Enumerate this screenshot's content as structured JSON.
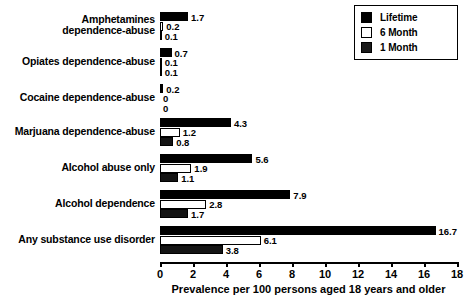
{
  "chart_data": {
    "type": "bar",
    "orientation": "horizontal",
    "title": "",
    "xlabel": "Prevalence per 100 persons aged 18 years and older",
    "ylabel": "",
    "xlim": [
      0,
      18
    ],
    "xticks": [
      0,
      2,
      4,
      6,
      8,
      10,
      12,
      14,
      16,
      18
    ],
    "grid": false,
    "legend_position": "top-right",
    "categories": [
      "Amphetamines dependence-abuse",
      "Opiates dependence-abuse",
      "Cocaine dependence-abuse",
      "Marjuana dependence-abuse",
      "Alcohol abuse only",
      "Alcohol dependence",
      "Any substance use disorder"
    ],
    "series": [
      {
        "name": "Lifetime",
        "color": "#000000",
        "values": [
          1.7,
          0.7,
          0.2,
          4.3,
          5.6,
          7.9,
          16.7
        ]
      },
      {
        "name": "6 Month",
        "color": "#ffffff",
        "values": [
          0.2,
          0.1,
          0,
          1.2,
          1.9,
          2.8,
          6.1
        ]
      },
      {
        "name": "1 Month",
        "color": "#141414",
        "values": [
          0.1,
          0.1,
          0,
          0.8,
          1.1,
          1.7,
          3.8
        ]
      }
    ],
    "value_labels": [
      [
        "1.7",
        "0.2",
        "0.1"
      ],
      [
        "0.7",
        "0.1",
        "0.1"
      ],
      [
        "0.2",
        "0",
        "0"
      ],
      [
        "4.3",
        "1.2",
        "0.8"
      ],
      [
        "5.6",
        "1.9",
        "1.1"
      ],
      [
        "7.9",
        "2.8",
        "1.7"
      ],
      [
        "16.7",
        "6.1",
        "3.8"
      ]
    ]
  },
  "legend": {
    "items": [
      {
        "label": "Lifetime",
        "swatch": "fill-black"
      },
      {
        "label": "6 Month",
        "swatch": "fill-white"
      },
      {
        "label": "1 Month",
        "swatch": "fill-dark"
      }
    ]
  },
  "category_lines": [
    [
      "Amphetamines",
      "dependence-abuse"
    ],
    [
      "Opiates dependence-abuse"
    ],
    [
      "Cocaine dependence-abuse"
    ],
    [
      "Marjuana dependence-abuse"
    ],
    [
      "Alcohol abuse only"
    ],
    [
      "Alcohol dependence"
    ],
    [
      "Any substance use disorder"
    ]
  ],
  "axis": {
    "tick_labels": [
      "0",
      "2",
      "4",
      "6",
      "8",
      "10",
      "12",
      "14",
      "16",
      "18"
    ],
    "title": "Prevalence per 100 persons aged 18 years and older"
  }
}
